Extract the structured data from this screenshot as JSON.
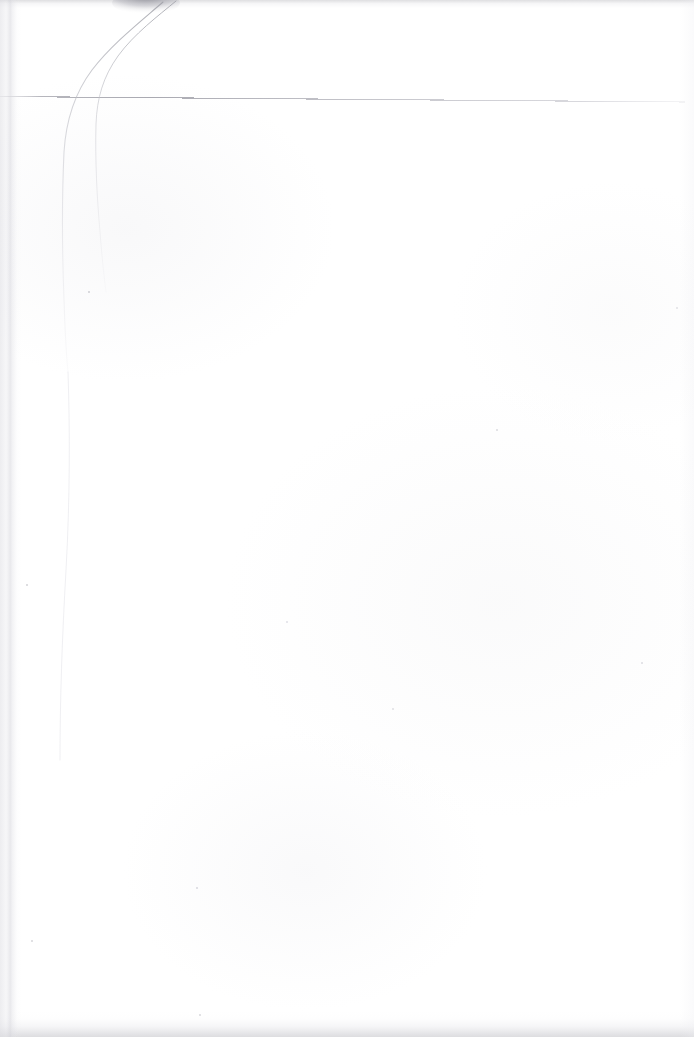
{
  "document": {
    "kind": "scanned-page",
    "description": "Blank scanned sheet of paper with a faint ruled line near the top",
    "width_px": 694,
    "height_px": 1037,
    "page_background_color": "#fefefe",
    "text_content": "",
    "visible_text_blocks": []
  },
  "marks": {
    "horizontal_rule": {
      "name": "faint horizontal ruled line",
      "color": "#b9b9bf",
      "start_x": 0,
      "start_y": 96,
      "end_x": 685,
      "end_y": 102,
      "stroke_width": 1
    },
    "pencil_strokes": [
      {
        "name": "left curved crease stroke",
        "color": "#c7c7cd",
        "path": "M 163 2 C 140 22, 112 44, 92 70 C 74 94, 66 120, 64 152 C 62 196, 62 248, 64 300 C 65 330, 66 352, 68 372"
      },
      {
        "name": "right curved crease stroke",
        "color": "#c9c9cf",
        "path": "M 176 1 C 158 16, 134 34, 118 56 C 103 77, 97 98, 96 124 C 95 160, 97 198, 100 232 C 102 258, 104 276, 106 292"
      }
    ],
    "top_smudge": {
      "name": "dark smudge at top edge",
      "color": "#8e8e96",
      "x": 115,
      "y": 0,
      "width": 62,
      "height": 12
    },
    "specks": [
      {
        "x": 88,
        "y": 291,
        "size": 2,
        "color": "#c0c0c6"
      },
      {
        "x": 26,
        "y": 584,
        "size": 2,
        "color": "#c4c4ca"
      },
      {
        "x": 31,
        "y": 940,
        "size": 2,
        "color": "#c9c9cf"
      },
      {
        "x": 196,
        "y": 887,
        "size": 1.5,
        "color": "#d2d2d8"
      },
      {
        "x": 199,
        "y": 1014,
        "size": 1.5,
        "color": "#d0d0d6"
      },
      {
        "x": 496,
        "y": 429,
        "size": 1.5,
        "color": "#d4d4da"
      },
      {
        "x": 641,
        "y": 662,
        "size": 1.5,
        "color": "#d6d6dc"
      },
      {
        "x": 392,
        "y": 708,
        "size": 1.5,
        "color": "#d8d8de"
      },
      {
        "x": 286,
        "y": 621,
        "size": 1.5,
        "color": "#dadae0"
      },
      {
        "x": 676,
        "y": 307,
        "size": 1.5,
        "color": "#dcdce2"
      }
    ]
  }
}
